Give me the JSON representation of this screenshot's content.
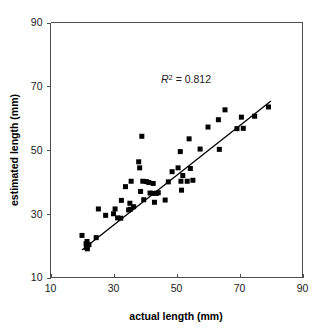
{
  "chart_data": {
    "type": "scatter",
    "title": "",
    "xlabel": "actual length (mm)",
    "ylabel": "estimated length (mm)",
    "xlim": [
      10,
      90
    ],
    "ylim": [
      10,
      90
    ],
    "xticks": [
      10,
      30,
      50,
      70,
      90
    ],
    "yticks": [
      10,
      30,
      50,
      70,
      90
    ],
    "xtick_labels": [
      "10",
      "30",
      "50",
      "70",
      "90"
    ],
    "ytick_labels": [
      "10",
      "30",
      "50",
      "70",
      "90"
    ],
    "grid": false,
    "legend": null,
    "annotations": [
      {
        "name": "r-squared",
        "symbol": "R",
        "superscript": "2",
        "equals": " = ",
        "value": "0.812",
        "text": "R2 = 0.812",
        "x": 56,
        "y": 74
      }
    ],
    "trendline": {
      "type": "linear-fit",
      "x_start": 20.0,
      "y_start": 18.6,
      "x_end": 80.0,
      "y_end": 65.4,
      "r_squared": 0.812
    },
    "marker": {
      "shape": "square",
      "color": "#000000",
      "size_px": 5
    },
    "points": [
      [
        20.0,
        23.2
      ],
      [
        21.3,
        20.6
      ],
      [
        21.4,
        19.4
      ],
      [
        21.6,
        21.3
      ],
      [
        21.7,
        19.0
      ],
      [
        22.2,
        20.3
      ],
      [
        24.5,
        22.5
      ],
      [
        25.2,
        31.5
      ],
      [
        27.5,
        29.5
      ],
      [
        30.0,
        30.0
      ],
      [
        30.5,
        31.5
      ],
      [
        31.3,
        28.7
      ],
      [
        32.3,
        28.6
      ],
      [
        32.5,
        34.2
      ],
      [
        33.8,
        38.5
      ],
      [
        34.8,
        31.2
      ],
      [
        35.2,
        33.3
      ],
      [
        35.3,
        31.4
      ],
      [
        35.6,
        40.2
      ],
      [
        36.4,
        32.2
      ],
      [
        38.0,
        46.3
      ],
      [
        38.3,
        44.4
      ],
      [
        38.6,
        37.0
      ],
      [
        39.0,
        54.3
      ],
      [
        39.3,
        40.2
      ],
      [
        39.6,
        34.4
      ],
      [
        40.4,
        40.1
      ],
      [
        41.2,
        39.8
      ],
      [
        41.6,
        36.5
      ],
      [
        42.4,
        36.4
      ],
      [
        42.6,
        39.5
      ],
      [
        43.0,
        33.6
      ],
      [
        43.6,
        36.4
      ],
      [
        44.2,
        36.6
      ],
      [
        46.4,
        34.3
      ],
      [
        47.4,
        40.0
      ],
      [
        48.6,
        43.2
      ],
      [
        50.5,
        44.4
      ],
      [
        51.2,
        49.5
      ],
      [
        51.4,
        40.2
      ],
      [
        51.6,
        37.4
      ],
      [
        52.0,
        42.0
      ],
      [
        53.4,
        40.2
      ],
      [
        54.0,
        53.5
      ],
      [
        54.4,
        44.2
      ],
      [
        55.2,
        40.5
      ],
      [
        57.5,
        50.3
      ],
      [
        60.0,
        57.2
      ],
      [
        63.3,
        59.5
      ],
      [
        63.6,
        50.2
      ],
      [
        65.4,
        62.6
      ],
      [
        69.2,
        56.7
      ],
      [
        70.6,
        60.3
      ],
      [
        71.2,
        56.8
      ],
      [
        74.8,
        60.6
      ],
      [
        79.2,
        63.5
      ]
    ]
  },
  "axes": {
    "x_label": "actual length (mm)",
    "y_label": "estimated length (mm)"
  }
}
